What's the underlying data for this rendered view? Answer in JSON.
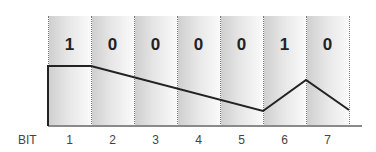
{
  "diagram": {
    "axis_label": "BIT",
    "bits": [
      {
        "position": "1",
        "value": "1"
      },
      {
        "position": "2",
        "value": "0"
      },
      {
        "position": "3",
        "value": "0"
      },
      {
        "position": "4",
        "value": "0"
      },
      {
        "position": "5",
        "value": "0"
      },
      {
        "position": "6",
        "value": "1"
      },
      {
        "position": "7",
        "value": "0"
      }
    ],
    "waveform_points": [
      [
        48,
        126
      ],
      [
        48,
        66
      ],
      [
        91,
        66
      ],
      [
        263,
        111
      ],
      [
        306,
        80
      ],
      [
        349,
        110
      ]
    ],
    "colors": {
      "line": "#222222",
      "divider": "#7a7a7a",
      "baseline": "#8a8a8a",
      "text": "#222222"
    }
  }
}
